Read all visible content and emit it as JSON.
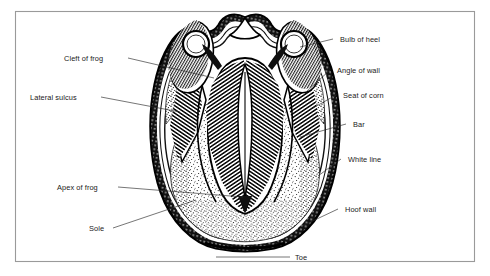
{
  "figure": {
    "background_color": "#ffffff",
    "frame_color": "#9a9a9a",
    "ink_color": "#000000",
    "labels": {
      "cleft_of_frog": "Cleft of frog",
      "lateral_sulcus": "Lateral sulcus",
      "apex_of_frog": "Apex of frog",
      "sole": "Sole",
      "bulb_of_heel": "Bulb of heel",
      "angle_of_wall": "Angle of wall",
      "seat_of_corn": "Seat of corn",
      "bar": "Bar",
      "white_line": "White line",
      "hoof_wall": "Hoof wall",
      "toe": "Toe"
    }
  }
}
